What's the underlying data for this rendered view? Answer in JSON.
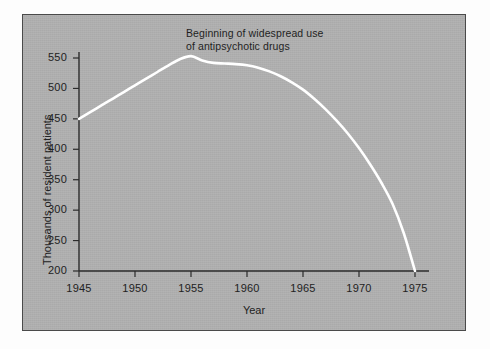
{
  "chart_data": {
    "type": "line",
    "title": "",
    "xlabel": "Year",
    "ylabel": "Thousands of resident patients",
    "xlim": [
      1945,
      1976
    ],
    "ylim": [
      190,
      570
    ],
    "xticks": [
      1945,
      1950,
      1955,
      1960,
      1965,
      1970,
      1975
    ],
    "xtick_labels": [
      "1945",
      "1950",
      "1955",
      "1960",
      "1965",
      "1970",
      "1975"
    ],
    "yticks": [
      200,
      250,
      300,
      350,
      400,
      450,
      500,
      550
    ],
    "ytick_labels": [
      "200",
      "250",
      "300",
      "350",
      "400",
      "450",
      "500",
      "550"
    ],
    "grid": false,
    "legend": null,
    "line_color": "#ffffff",
    "background_color": "#b0b0b0",
    "series": [
      {
        "name": "Resident patients in state and county mental hospitals",
        "x": [
          1945,
          1946,
          1947,
          1948,
          1949,
          1950,
          1951,
          1952,
          1953,
          1954,
          1955,
          1956,
          1957,
          1958,
          1959,
          1960,
          1961,
          1962,
          1963,
          1964,
          1965,
          1966,
          1967,
          1968,
          1969,
          1970,
          1971,
          1972,
          1973,
          1974,
          1975
        ],
        "values": [
          450,
          461,
          472,
          483,
          494,
          505,
          516,
          527,
          538,
          548,
          553,
          546,
          542,
          541,
          540,
          538,
          534,
          528,
          520,
          510,
          498,
          483,
          466,
          447,
          426,
          402,
          375,
          345,
          310,
          262,
          200
        ]
      }
    ],
    "annotations": [
      {
        "text": "Beginning of widespread use\nof antipsychotic drugs",
        "x": 1955,
        "y": 560
      }
    ]
  }
}
